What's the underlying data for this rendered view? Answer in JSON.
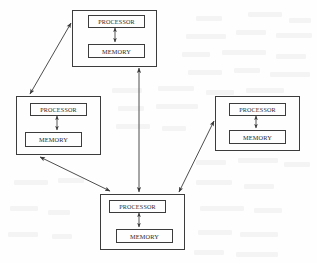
{
  "figure": {
    "kind": "block-diagram",
    "background_color": "#ffffff",
    "line_color": "#3a3a3a",
    "text_color": "#2b2b2b"
  },
  "labels": {
    "processor": "PROCESSOR",
    "memory": "MEMORY"
  },
  "nodes": [
    {
      "id": "node-top",
      "name": "node-top",
      "x": 72,
      "y": 10,
      "w": 85,
      "h": 57,
      "processor": {
        "x": 15,
        "y": 4,
        "w": 57,
        "h": 13
      },
      "memory": {
        "x": 15,
        "y": 33,
        "w": 57,
        "h": 14
      },
      "internal_link": {
        "x": 43,
        "y1": 18,
        "y2": 32
      }
    },
    {
      "id": "node-left",
      "name": "node-left",
      "x": 16,
      "y": 96,
      "w": 85,
      "h": 59,
      "processor": {
        "x": 13,
        "y": 6,
        "w": 57,
        "h": 13
      },
      "memory": {
        "x": 8,
        "y": 35,
        "w": 57,
        "h": 15
      },
      "internal_link": {
        "x": 41,
        "y1": 20,
        "y2": 34
      }
    },
    {
      "id": "node-right",
      "name": "node-right",
      "x": 215,
      "y": 96,
      "w": 85,
      "h": 55,
      "processor": {
        "x": 13,
        "y": 6,
        "w": 57,
        "h": 13
      },
      "memory": {
        "x": 13,
        "y": 33,
        "w": 57,
        "h": 14
      },
      "internal_link": {
        "x": 41,
        "y1": 20,
        "y2": 32
      }
    },
    {
      "id": "node-bottom",
      "name": "node-bottom",
      "x": 100,
      "y": 194,
      "w": 85,
      "h": 56,
      "processor": {
        "x": 8,
        "y": 5,
        "w": 57,
        "h": 13
      },
      "memory": {
        "x": 15,
        "y": 34,
        "w": 57,
        "h": 14
      },
      "internal_link": {
        "x": 39,
        "y1": 19,
        "y2": 33
      }
    }
  ],
  "links": [
    {
      "id": "link-top-left",
      "name": "link-top-node-to-left-node",
      "from": "node-top",
      "to": "node-left",
      "x1": 71,
      "y1": 23,
      "x2": 30,
      "y2": 94,
      "arrowheads": "both"
    },
    {
      "id": "link-left-bottom",
      "name": "link-left-node-to-bottom-node",
      "from": "node-left",
      "to": "node-bottom",
      "x1": 40,
      "y1": 157,
      "x2": 110,
      "y2": 191,
      "arrowheads": "both"
    },
    {
      "id": "link-top-bottom",
      "name": "link-top-node-to-bottom-node",
      "from": "node-top",
      "to": "node-bottom",
      "x1": 139,
      "y1": 68,
      "x2": 139,
      "y2": 192,
      "arrowheads": "both"
    },
    {
      "id": "link-right-bottom",
      "name": "link-right-node-to-bottom-node",
      "from": "node-right",
      "to": "node-bottom",
      "x1": 214,
      "y1": 121,
      "x2": 179,
      "y2": 192,
      "arrowheads": "both"
    }
  ],
  "ghost_marks": [
    {
      "x": 196,
      "y": 16,
      "w": 26
    },
    {
      "x": 248,
      "y": 12,
      "w": 34
    },
    {
      "x": 289,
      "y": 18,
      "w": 22
    },
    {
      "x": 186,
      "y": 34,
      "w": 40
    },
    {
      "x": 236,
      "y": 30,
      "w": 30
    },
    {
      "x": 276,
      "y": 33,
      "w": 36
    },
    {
      "x": 182,
      "y": 52,
      "w": 28
    },
    {
      "x": 222,
      "y": 50,
      "w": 44
    },
    {
      "x": 276,
      "y": 54,
      "w": 30
    },
    {
      "x": 188,
      "y": 70,
      "w": 34
    },
    {
      "x": 234,
      "y": 68,
      "w": 26
    },
    {
      "x": 270,
      "y": 72,
      "w": 40
    },
    {
      "x": 112,
      "y": 88,
      "w": 30
    },
    {
      "x": 158,
      "y": 86,
      "w": 36
    },
    {
      "x": 206,
      "y": 90,
      "w": 28
    },
    {
      "x": 246,
      "y": 88,
      "w": 38
    },
    {
      "x": 118,
      "y": 106,
      "w": 26
    },
    {
      "x": 156,
      "y": 104,
      "w": 42
    },
    {
      "x": 116,
      "y": 124,
      "w": 34
    },
    {
      "x": 162,
      "y": 126,
      "w": 24
    },
    {
      "x": 196,
      "y": 160,
      "w": 30
    },
    {
      "x": 238,
      "y": 158,
      "w": 40
    },
    {
      "x": 284,
      "y": 162,
      "w": 26
    },
    {
      "x": 14,
      "y": 180,
      "w": 34
    },
    {
      "x": 58,
      "y": 178,
      "w": 26
    },
    {
      "x": 196,
      "y": 180,
      "w": 36
    },
    {
      "x": 244,
      "y": 184,
      "w": 30
    },
    {
      "x": 10,
      "y": 206,
      "w": 28
    },
    {
      "x": 48,
      "y": 210,
      "w": 22
    },
    {
      "x": 200,
      "y": 206,
      "w": 44
    },
    {
      "x": 254,
      "y": 208,
      "w": 28
    },
    {
      "x": 8,
      "y": 232,
      "w": 30
    },
    {
      "x": 52,
      "y": 234,
      "w": 20
    },
    {
      "x": 198,
      "y": 230,
      "w": 34
    },
    {
      "x": 240,
      "y": 232,
      "w": 38
    },
    {
      "x": 194,
      "y": 250,
      "w": 30
    },
    {
      "x": 236,
      "y": 252,
      "w": 42
    }
  ]
}
